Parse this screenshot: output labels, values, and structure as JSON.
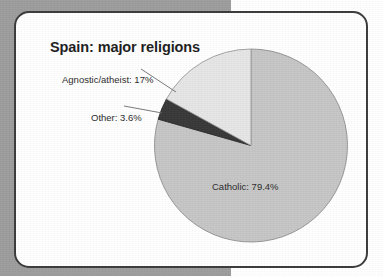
{
  "figure": {
    "title": "Spain: major religions",
    "frame_border_color": "#3b3b3b",
    "page_background_color": "#9d9d9d",
    "panel_background_color": "#ffffff"
  },
  "chart_data": {
    "type": "pie",
    "title": "Spain: major religions",
    "xlabel": "",
    "ylabel": "",
    "legend_position": "none",
    "grid": false,
    "units": "percent",
    "start_angle_deg": 90,
    "direction": "counterclockwise",
    "categories": [
      "Catholic",
      "Agnostic/atheist",
      "Other"
    ],
    "values": [
      79.4,
      17.0,
      3.6
    ],
    "labels": [
      "Catholic: 79.4%",
      "Agnostic/atheist: 17%",
      "Other: 3.6%"
    ],
    "colors": [
      "#c6c6c6",
      "#e6e6e6",
      "#383838"
    ],
    "slices": [
      {
        "name": "Catholic",
        "value": 79.4,
        "label": "Catholic: 79.4%",
        "color": "#c6c6c6",
        "label_placement": "inside"
      },
      {
        "name": "Agnostic/atheist",
        "value": 17.0,
        "label": "Agnostic/atheist: 17%",
        "color": "#e6e6e6",
        "label_placement": "outside-left"
      },
      {
        "name": "Other",
        "value": 3.6,
        "label": "Other: 3.6%",
        "color": "#383838",
        "label_placement": "outside-left"
      }
    ]
  }
}
